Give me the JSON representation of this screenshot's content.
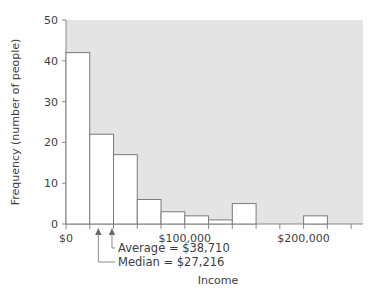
{
  "chart_data": {
    "type": "bar",
    "title": "",
    "xlabel": "Income",
    "ylabel": "Frequency (number of people)",
    "ylim": [
      0,
      50
    ],
    "xlim": [
      0,
      250000
    ],
    "grid": false,
    "legend": "none",
    "bar_fill": "#ffffff",
    "bar_edge": "#7a7a7a",
    "plot_background": "#e4e4e4",
    "bin_width": 20000,
    "categories": [
      "$0–20k",
      "$20–40k",
      "$40–60k",
      "$60–80k",
      "$80–100k",
      "$100–120k",
      "$120–140k",
      "$140–160k",
      "$200–220k"
    ],
    "bin_starts": [
      0,
      20000,
      40000,
      60000,
      80000,
      100000,
      120000,
      140000,
      200000
    ],
    "values": [
      42,
      22,
      17,
      6,
      3,
      2,
      1,
      5,
      2
    ],
    "ytick_labels": [
      "0",
      "10",
      "20",
      "30",
      "40",
      "50"
    ],
    "ytick_values": [
      0,
      10,
      20,
      30,
      40,
      50
    ],
    "xtick_labels": [
      "$0",
      "$100,000",
      "$200,000"
    ],
    "xtick_values": [
      0,
      100000,
      200000
    ],
    "xtick_minor_values": [
      20000,
      40000,
      60000,
      80000,
      120000,
      140000,
      160000,
      180000,
      220000,
      240000
    ],
    "annotations": [
      {
        "name": "median",
        "label": "Median  = $27,216",
        "value": 27216
      },
      {
        "name": "average",
        "label": "Average = $38,710",
        "value": 38710
      }
    ]
  }
}
